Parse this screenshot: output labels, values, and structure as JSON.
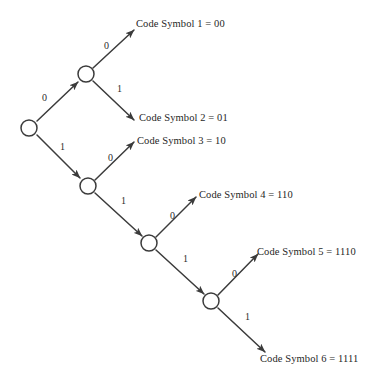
{
  "figure": {
    "kind": "binary-code-tree",
    "background_color": "#ffffff",
    "stroke_color": "#3b3b3b",
    "text_color": "#1f1f1f"
  },
  "nodes": [
    {
      "id": "root",
      "name": "root-node",
      "cx": 29,
      "cy": 128
    },
    {
      "id": "n0",
      "name": "node-0",
      "cx": 86,
      "cy": 74
    },
    {
      "id": "n1",
      "name": "node-1",
      "cx": 88,
      "cy": 186
    },
    {
      "id": "n11",
      "name": "node-11",
      "cx": 149,
      "cy": 243
    },
    {
      "id": "n111",
      "name": "node-111",
      "cx": 211,
      "cy": 301
    }
  ],
  "edges": [
    {
      "id": "e-root-0",
      "bit": "0",
      "label_x": 42,
      "label_y": 93,
      "x1": 37,
      "y1": 121,
      "x2": 78,
      "y2": 82
    },
    {
      "id": "e-root-1",
      "bit": "1",
      "label_x": 60,
      "label_y": 142,
      "x1": 37,
      "y1": 135,
      "x2": 80,
      "y2": 178
    },
    {
      "id": "e-0-00",
      "bit": "0",
      "label_x": 104,
      "label_y": 41,
      "x1": 93,
      "y1": 68,
      "x2": 134,
      "y2": 30
    },
    {
      "id": "e-0-01",
      "bit": "1",
      "label_x": 117,
      "label_y": 84,
      "x1": 93,
      "y1": 81,
      "x2": 134,
      "y2": 120
    },
    {
      "id": "e-1-10",
      "bit": "0",
      "label_x": 108,
      "label_y": 153,
      "x1": 95,
      "y1": 180,
      "x2": 134,
      "y2": 142
    },
    {
      "id": "e-1-11",
      "bit": "1",
      "label_x": 121,
      "label_y": 196,
      "x1": 95,
      "y1": 193,
      "x2": 142,
      "y2": 236
    },
    {
      "id": "e-11-110",
      "bit": "0",
      "label_x": 170,
      "label_y": 211,
      "x1": 156,
      "y1": 237,
      "x2": 196,
      "y2": 197
    },
    {
      "id": "e-11-111",
      "bit": "1",
      "label_x": 183,
      "label_y": 254,
      "x1": 156,
      "y1": 250,
      "x2": 204,
      "y2": 294
    },
    {
      "id": "e-111-1110",
      "bit": "0",
      "label_x": 232,
      "label_y": 269,
      "x1": 218,
      "y1": 295,
      "x2": 258,
      "y2": 254
    },
    {
      "id": "e-111-1111",
      "bit": "1",
      "label_x": 245,
      "label_y": 312,
      "x1": 218,
      "y1": 308,
      "x2": 265,
      "y2": 352
    }
  ],
  "leaf_labels": [
    {
      "id": "leaf-1",
      "text": "Code Symbol 1 = 00",
      "x": 136,
      "y": 19
    },
    {
      "id": "leaf-2",
      "text": "Code Symbol 2 = 01",
      "x": 139,
      "y": 113
    },
    {
      "id": "leaf-3",
      "text": "Code Symbol 3 = 10",
      "x": 137,
      "y": 136
    },
    {
      "id": "leaf-4",
      "text": "Code Symbol 4 = 110",
      "x": 199,
      "y": 190
    },
    {
      "id": "leaf-5",
      "text": "Code Symbol 5 = 1110",
      "x": 257,
      "y": 247
    },
    {
      "id": "leaf-6",
      "text": "Code Symbol 6 = 1111",
      "x": 260,
      "y": 354
    }
  ]
}
